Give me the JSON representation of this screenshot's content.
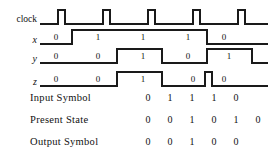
{
  "diagram": {
    "type": "digital-timing-diagram",
    "stroke_color": "#1a1a1a",
    "background_color": "#ffffff",
    "time_axis": {
      "clock_period_px": 45,
      "first_clock_edge_px": 58,
      "clock_pulses": 5
    },
    "signals": [
      {
        "id": "clock",
        "label": "clock",
        "italic": false,
        "baseline_y": 24,
        "high_y": 10,
        "kind": "pulse-train",
        "pulses": [
          {
            "start": 58,
            "end": 65
          },
          {
            "start": 103,
            "end": 110
          },
          {
            "start": 148,
            "end": 155
          },
          {
            "start": 193,
            "end": 200
          },
          {
            "start": 238,
            "end": 245
          }
        ],
        "line_start": 40,
        "line_end": 268
      },
      {
        "id": "x",
        "label": "x",
        "italic": true,
        "baseline_y": 44,
        "high_y": 30,
        "kind": "level",
        "line_start": 40,
        "line_end": 268,
        "transitions": [
          {
            "x": 72,
            "to": 1
          },
          {
            "x": 207,
            "to": 0
          }
        ],
        "level_labels": [
          {
            "text": "0",
            "x": 56,
            "y": 33
          },
          {
            "text": "1",
            "x": 98,
            "y": 33
          },
          {
            "text": "1",
            "x": 143,
            "y": 33
          },
          {
            "text": "1",
            "x": 188,
            "y": 33
          },
          {
            "text": "0",
            "x": 224,
            "y": 33
          }
        ]
      },
      {
        "id": "y",
        "label": "y",
        "italic": true,
        "baseline_y": 63,
        "high_y": 49,
        "kind": "level",
        "line_start": 40,
        "line_end": 268,
        "transitions": [
          {
            "x": 117,
            "to": 1
          },
          {
            "x": 162,
            "to": 0
          },
          {
            "x": 207,
            "to": 1
          },
          {
            "x": 252,
            "to": 0
          }
        ],
        "level_labels": [
          {
            "text": "0",
            "x": 56,
            "y": 52
          },
          {
            "text": "0",
            "x": 98,
            "y": 52
          },
          {
            "text": "1",
            "x": 143,
            "y": 52
          },
          {
            "text": "0",
            "x": 188,
            "y": 52
          },
          {
            "text": "1",
            "x": 229,
            "y": 52
          }
        ]
      },
      {
        "id": "z",
        "label": "z",
        "italic": true,
        "baseline_y": 86,
        "high_y": 72,
        "kind": "level",
        "line_start": 40,
        "line_end": 268,
        "transitions": [
          {
            "x": 117,
            "to": 1
          },
          {
            "x": 162,
            "to": 0
          },
          {
            "x": 205,
            "to": 1
          },
          {
            "x": 212,
            "to": 0
          }
        ],
        "level_labels": [
          {
            "text": "0",
            "x": 56,
            "y": 75
          },
          {
            "text": "0",
            "x": 98,
            "y": 75
          },
          {
            "text": "1",
            "x": 143,
            "y": 75
          },
          {
            "text": "0",
            "x": 193,
            "y": 75
          },
          {
            "text": "0",
            "x": 224,
            "y": 75
          }
        ]
      }
    ]
  },
  "table": {
    "rows": [
      {
        "id": "input-symbol",
        "label": "Input Symbol",
        "values": [
          "0",
          "1",
          "1",
          "1",
          "0"
        ]
      },
      {
        "id": "present-state",
        "label": "Present State",
        "values": [
          "0",
          "0",
          "1",
          "0",
          "1",
          "0"
        ]
      },
      {
        "id": "output-symbol",
        "label": "Output Symbol",
        "values": [
          "0",
          "0",
          "1",
          "0",
          "0"
        ]
      }
    ],
    "column_x": [
      148,
      170,
      192,
      214,
      236,
      258
    ],
    "row_y": [
      98,
      120,
      142
    ]
  }
}
